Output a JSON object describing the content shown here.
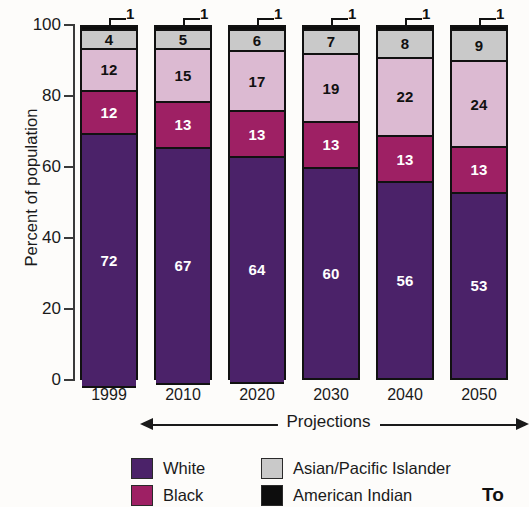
{
  "chart_data": {
    "type": "bar",
    "stacked": true,
    "title": "",
    "xlabel": "",
    "ylabel": "Percent of population",
    "ylim": [
      0,
      100
    ],
    "yticks": [
      0,
      20,
      40,
      60,
      80,
      100
    ],
    "grid": false,
    "legend_position": "bottom",
    "categories": [
      "1999",
      "2010",
      "2020",
      "2030",
      "2040",
      "2050"
    ],
    "series": [
      {
        "name": "White",
        "color": "#4b2269",
        "values": [
          72,
          67,
          64,
          60,
          56,
          53
        ]
      },
      {
        "name": "Black",
        "color": "#9e2064",
        "values": [
          12,
          13,
          13,
          13,
          13,
          13
        ]
      },
      {
        "name": "Hispanic",
        "color": "#dcbad2",
        "values": [
          12,
          15,
          17,
          19,
          22,
          24
        ]
      },
      {
        "name": "Asian/Pacific Islander",
        "color": "#c9c9c9",
        "values": [
          4,
          5,
          6,
          7,
          8,
          9
        ]
      },
      {
        "name": "American Indian",
        "color": "#0d0d0d",
        "values": [
          1,
          1,
          1,
          1,
          1,
          1
        ]
      }
    ],
    "annotations": [
      {
        "text": "1",
        "category": "1999",
        "series": "American Indian"
      },
      {
        "text": "1",
        "category": "2010",
        "series": "American Indian"
      },
      {
        "text": "1",
        "category": "2020",
        "series": "American Indian"
      },
      {
        "text": "1",
        "category": "2030",
        "series": "American Indian"
      },
      {
        "text": "1",
        "category": "2040",
        "series": "American Indian"
      },
      {
        "text": "1",
        "category": "2050",
        "series": "American Indian"
      }
    ]
  },
  "axis": {
    "y_title": "Percent of population",
    "y_ticks": [
      "100",
      "80",
      "60",
      "40",
      "20",
      "0"
    ],
    "x_ticks": [
      "1999",
      "2010",
      "2020",
      "2030",
      "2040",
      "2050"
    ]
  },
  "projections": {
    "label": "Projections"
  },
  "legend": {
    "entries": [
      {
        "label": "White",
        "color": "#4b2269"
      },
      {
        "label": "Asian/Pacific Islander",
        "color": "#c9c9c9"
      },
      {
        "label": "Black",
        "color": "#9e2064"
      },
      {
        "label": "American Indian",
        "color": "#0d0d0d"
      }
    ]
  },
  "corner_note": {
    "text": "To"
  },
  "colors": {
    "white_series": "#4b2269",
    "black_series": "#9e2064",
    "hispanic_series": "#dcbad2",
    "asian_series": "#c9c9c9",
    "american_indian_series": "#0d0d0d",
    "background": "#fdfcfa",
    "outline": "#111111"
  }
}
